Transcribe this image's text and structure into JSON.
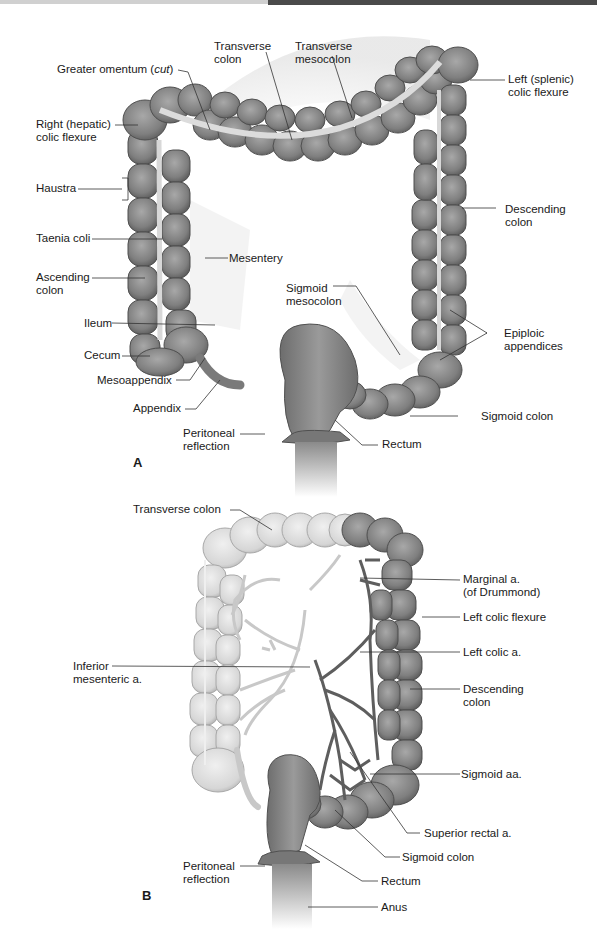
{
  "figure": {
    "panels": [
      {
        "id": "A",
        "label": "A",
        "labels": [
          {
            "line1": "Transverse",
            "line2": "colon"
          },
          {
            "line1": "Transverse",
            "line2": "mesocolon"
          },
          {
            "line1": "Greater omentum (",
            "italic": "cut",
            "suffix": ")"
          },
          {
            "line1": "Left (splenic)",
            "line2": "colic flexure"
          },
          {
            "line1": "Right (hepatic)",
            "line2": "colic flexure"
          },
          {
            "line1": "Haustra"
          },
          {
            "line1": "Descending",
            "line2": "colon"
          },
          {
            "line1": "Taenia coli"
          },
          {
            "line1": "Mesentery"
          },
          {
            "line1": "Ascending",
            "line2": "colon"
          },
          {
            "line1": "Sigmoid",
            "line2": "mesocolon"
          },
          {
            "line1": "Ileum"
          },
          {
            "line1": "Epiploic",
            "line2": "appendices"
          },
          {
            "line1": "Cecum"
          },
          {
            "line1": "Mesoappendix"
          },
          {
            "line1": "Appendix"
          },
          {
            "line1": "Sigmoid colon"
          },
          {
            "line1": "Peritoneal",
            "line2": "reflection"
          },
          {
            "line1": "Rectum"
          }
        ]
      },
      {
        "id": "B",
        "label": "B",
        "labels": [
          {
            "line1": "Transverse colon"
          },
          {
            "line1": "Marginal a.",
            "line2": "(of Drummond)"
          },
          {
            "line1": "Left colic flexure"
          },
          {
            "line1": "Inferior",
            "line2": "mesenteric a."
          },
          {
            "line1": "Left colic a."
          },
          {
            "line1": "Descending",
            "line2": "colon"
          },
          {
            "line1": "Sigmoid aa."
          },
          {
            "line1": "Superior rectal a."
          },
          {
            "line1": "Sigmoid colon"
          },
          {
            "line1": "Peritoneal",
            "line2": "reflection"
          },
          {
            "line1": "Rectum"
          },
          {
            "line1": "Anus"
          }
        ]
      }
    ],
    "colors": {
      "colon_dark": "#7a7a7a",
      "colon_mid": "#8c8c8c",
      "colon_light": "#d6d6d6",
      "artery_dark": "#5a5a5a",
      "artery_light": "#c8c8c8",
      "leader_line": "#333333",
      "header_dark": "#4a4a4a"
    }
  }
}
